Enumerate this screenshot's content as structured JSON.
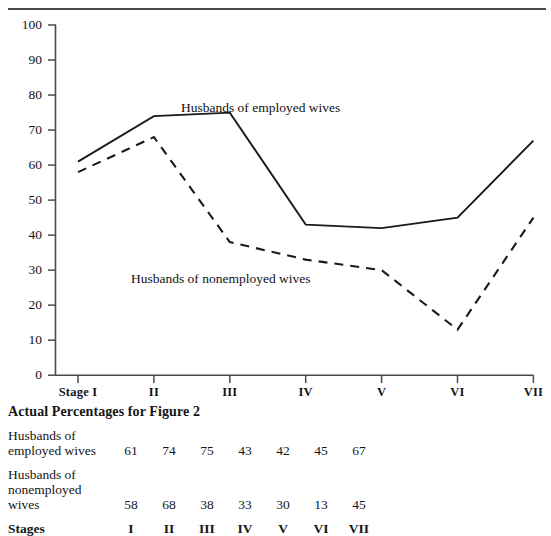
{
  "figure": {
    "divider_icon": "horizontal-rule"
  },
  "chart_data": {
    "type": "line",
    "title": "",
    "xlabel": "",
    "ylabel": "",
    "categories": [
      "Stage I",
      "II",
      "III",
      "IV",
      "V",
      "VI",
      "VII"
    ],
    "ylim": [
      0,
      100
    ],
    "yticks": [
      0,
      10,
      20,
      30,
      40,
      50,
      60,
      70,
      80,
      90,
      100
    ],
    "ytick_labels": [
      "0",
      "10",
      "20",
      "30",
      "40",
      "50",
      "60",
      "70",
      "80",
      "90",
      "100"
    ],
    "grid": false,
    "legend_position": "inline-annotation",
    "series": [
      {
        "name": "Husbands of employed wives",
        "style": "solid",
        "values": [
          61,
          74,
          75,
          43,
          42,
          45,
          67
        ]
      },
      {
        "name": "Husbands of nonemployed wives",
        "style": "dashed",
        "values": [
          58,
          68,
          38,
          33,
          30,
          13,
          45
        ]
      }
    ],
    "annotations": [
      {
        "text": "Husbands of employed wives",
        "x_px": 181,
        "y_px": 100
      },
      {
        "text": "Husbands of nonemployed wives",
        "x_px": 131,
        "y_px": 271
      }
    ]
  },
  "table": {
    "title": "Actual Percentages for Figure 2",
    "rows": [
      {
        "label": "Husbands of\nemployed wives",
        "values": [
          "61",
          "74",
          "75",
          "43",
          "42",
          "45",
          "67"
        ]
      },
      {
        "label": "Husbands of\nnonemployed\nwives",
        "values": [
          "58",
          "68",
          "38",
          "33",
          "30",
          "13",
          "45"
        ]
      }
    ],
    "stages_label": "Stages",
    "stages_values": [
      "I",
      "II",
      "III",
      "IV",
      "V",
      "VI",
      "VII"
    ]
  },
  "colors": {
    "ink": "#151515",
    "axis": "#4a4a4a",
    "series_solid": "#1a1a1a",
    "series_dashed": "#1a1a1a",
    "background": "#ffffff"
  }
}
